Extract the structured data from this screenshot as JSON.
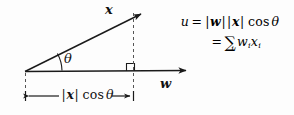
{
  "figure": {
    "type": "vector-projection-diagram",
    "background_color": "#fdfdfd",
    "ink_color": "#1a1a1a",
    "labels": {
      "vector_x": "x",
      "vector_w": "w",
      "angle_theta": "θ",
      "projection_length": {
        "norm_open": "|",
        "vector": "x",
        "norm_close": "|",
        "cos": "cos",
        "theta": "θ"
      }
    },
    "right_angle_marker": true,
    "dashed_guides": 2
  },
  "formula": {
    "line1": {
      "lhs": "u",
      "equals": "=",
      "norm_w_open": "|",
      "w": "w",
      "norm_w_close": "|",
      "norm_x_open": "|",
      "x": "x",
      "norm_x_close": "|",
      "cos": "cos",
      "theta": "θ"
    },
    "line2": {
      "equals": "=",
      "sum": "∑",
      "index": "i",
      "w": "w",
      "w_sub": "i",
      "x": "x",
      "x_sub": "i"
    }
  },
  "geometry": {
    "origin": {
      "x": 25,
      "y": 72
    },
    "w_tip": {
      "x": 186,
      "y": 71
    },
    "x_tip": {
      "x": 141,
      "y": 14
    },
    "projection_foot": {
      "x": 133,
      "y": 71
    },
    "dimension_line_y": 96,
    "angle_degrees": 19
  }
}
